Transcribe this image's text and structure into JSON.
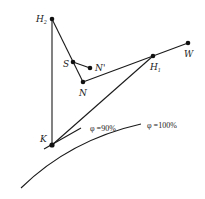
{
  "diagram": {
    "points": {
      "H2": {
        "label": "H",
        "sub": "2",
        "x": 52,
        "y": 19
      },
      "S": {
        "label": "S",
        "x": 73,
        "y": 62
      },
      "Nprime": {
        "label": "N'",
        "x": 90,
        "y": 68
      },
      "N": {
        "label": "N",
        "x": 83,
        "y": 82
      },
      "H1": {
        "label": "H",
        "sub": "1",
        "x": 153,
        "y": 56
      },
      "W": {
        "label": "W",
        "x": 188,
        "y": 43
      },
      "K": {
        "label": "K",
        "x": 52,
        "y": 145
      }
    },
    "curves": {
      "phi90": {
        "label": "φ =90%"
      },
      "phi100": {
        "label": "φ =100%"
      }
    },
    "colors": {
      "stroke": "#1a1a1a",
      "text": "#222222",
      "background": "#ffffff"
    }
  }
}
